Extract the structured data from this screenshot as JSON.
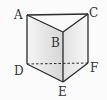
{
  "figure": {
    "vertices": {
      "A": "A",
      "B": "B",
      "C": "C",
      "D": "D",
      "E": "E",
      "F": "F"
    },
    "edges": [
      {
        "from": "A",
        "to": "C",
        "style": "solid"
      },
      {
        "from": "A",
        "to": "B",
        "style": "solid"
      },
      {
        "from": "B",
        "to": "C",
        "style": "solid"
      },
      {
        "from": "A",
        "to": "D",
        "style": "solid"
      },
      {
        "from": "B",
        "to": "E",
        "style": "solid"
      },
      {
        "from": "C",
        "to": "F",
        "style": "solid"
      },
      {
        "from": "D",
        "to": "E",
        "style": "solid"
      },
      {
        "from": "E",
        "to": "F",
        "style": "solid"
      },
      {
        "from": "D",
        "to": "F",
        "style": "dashed"
      }
    ],
    "colors": {
      "line": "#2a2a2a",
      "label": "#333333",
      "face_left_light": "#f4f4f4",
      "face_left_dark": "#d8d8d8",
      "face_right_light": "#f6f6f6",
      "face_right_dark": "#e4e4e4",
      "top_face": "#fafafa",
      "background": "#fbfbfb"
    }
  }
}
